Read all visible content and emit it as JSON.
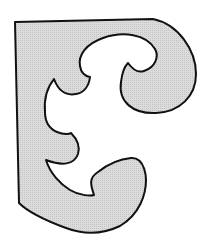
{
  "figure": {
    "fill_color": "#d9d9d9",
    "stroke_color": "#111111",
    "background": "#ffffff"
  }
}
